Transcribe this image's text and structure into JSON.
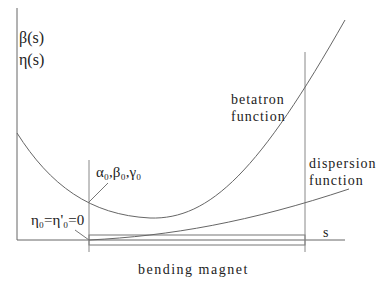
{
  "axes": {
    "y_label_1": "β(s)",
    "y_label_2": "η(s)",
    "x_label": "s"
  },
  "curves": {
    "betatron_label_1": "betatron",
    "betatron_label_2": "function",
    "dispersion_label_1": "dispersion",
    "dispersion_label_2": "function"
  },
  "annotations": {
    "initial_twiss": "α₀,β₀,γ₀",
    "initial_dispersion": "η₀=η'₀=0"
  },
  "magnet": {
    "label": "bending magnet"
  },
  "colors": {
    "line": "#555555",
    "text": "#222222",
    "background": "#ffffff"
  }
}
